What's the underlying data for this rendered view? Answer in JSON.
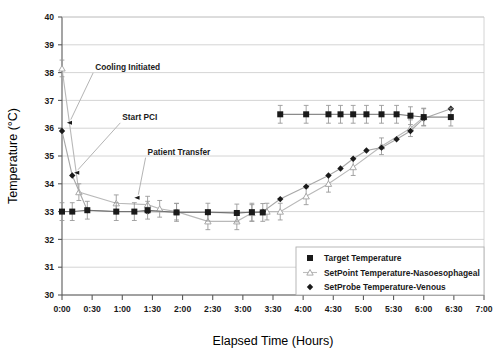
{
  "chart_data": {
    "type": "line",
    "title": "",
    "xlabel": "Elapsed Time (Hours)",
    "ylabel": "Temperature (°C)",
    "ylim": [
      30,
      40
    ],
    "ytick_labels": [
      "30",
      "31",
      "32",
      "33",
      "34",
      "35",
      "36",
      "37",
      "38",
      "39",
      "40"
    ],
    "ytick_values": [
      30,
      31,
      32,
      33,
      34,
      35,
      36,
      37,
      38,
      39,
      40
    ],
    "xlim_hours": [
      0,
      7
    ],
    "xtick_labels": [
      "0:00",
      "0:30",
      "1:00",
      "1:30",
      "2:00",
      "2:30",
      "3:00",
      "3:30",
      "4:00",
      "4:30",
      "5:00",
      "5:30",
      "6:00",
      "6:30",
      "7:00"
    ],
    "xtick_values_hours": [
      0,
      0.5,
      1,
      1.5,
      2,
      2.5,
      3,
      3.5,
      4,
      4.5,
      5,
      5.5,
      6,
      6.5,
      7
    ],
    "grid": "horizontal",
    "legend_position": "inside-bottom-right",
    "series": [
      {
        "name": "Target Temperature",
        "marker": "filled-square",
        "color": "#1a1a1a",
        "has_error_bars": true,
        "error": 0.32,
        "points": [
          {
            "x": 0.0,
            "y": 33.0
          },
          {
            "x": 0.17,
            "y": 33.0
          },
          {
            "x": 0.42,
            "y": 33.05
          },
          {
            "x": 0.9,
            "y": 33.0
          },
          {
            "x": 1.2,
            "y": 33.0
          },
          {
            "x": 1.42,
            "y": 33.05
          },
          {
            "x": 1.9,
            "y": 32.97
          },
          {
            "x": 2.42,
            "y": 32.98
          },
          {
            "x": 2.9,
            "y": 32.95
          },
          {
            "x": 3.15,
            "y": 32.98
          },
          {
            "x": 3.33,
            "y": 32.97
          },
          {
            "x": 3.62,
            "y": 36.5
          },
          {
            "x": 4.05,
            "y": 36.5
          },
          {
            "x": 4.42,
            "y": 36.5
          },
          {
            "x": 4.62,
            "y": 36.5
          },
          {
            "x": 4.83,
            "y": 36.5
          },
          {
            "x": 5.05,
            "y": 36.5
          },
          {
            "x": 5.3,
            "y": 36.5
          },
          {
            "x": 5.55,
            "y": 36.5
          },
          {
            "x": 5.78,
            "y": 36.45
          },
          {
            "x": 6.0,
            "y": 36.4
          },
          {
            "x": 6.45,
            "y": 36.4
          }
        ]
      },
      {
        "name": "SetPoint Temperature-Nasoesophageal",
        "marker": "open-triangle",
        "color": "#b9b9b9",
        "has_error_bars": true,
        "error": 0.3,
        "points": [
          {
            "x": 0.0,
            "y": 38.15
          },
          {
            "x": 0.28,
            "y": 33.7
          },
          {
            "x": 0.9,
            "y": 33.3
          },
          {
            "x": 1.42,
            "y": 33.25
          },
          {
            "x": 1.62,
            "y": 33.1
          },
          {
            "x": 1.9,
            "y": 33.0
          },
          {
            "x": 2.42,
            "y": 32.65
          },
          {
            "x": 2.9,
            "y": 32.65
          },
          {
            "x": 3.15,
            "y": 32.95
          },
          {
            "x": 3.4,
            "y": 33.0
          },
          {
            "x": 3.62,
            "y": 33.0
          },
          {
            "x": 4.05,
            "y": 33.55
          },
          {
            "x": 4.42,
            "y": 34.0
          },
          {
            "x": 4.83,
            "y": 34.6
          },
          {
            "x": 5.3,
            "y": 35.35
          },
          {
            "x": 5.78,
            "y": 36.0
          },
          {
            "x": 6.0,
            "y": 36.4
          }
        ]
      },
      {
        "name": "SetProbe Temperature-Venous",
        "marker": "filled-diamond",
        "color": "#1a1a1a",
        "has_error_bars": false,
        "points": [
          {
            "x": 0.0,
            "y": 35.9
          },
          {
            "x": 0.17,
            "y": 34.3
          },
          {
            "x": 0.42,
            "y": 33.05
          },
          {
            "x": 0.9,
            "y": 33.0
          },
          {
            "x": 1.42,
            "y": 33.0
          },
          {
            "x": 1.9,
            "y": 32.98
          },
          {
            "x": 2.42,
            "y": 32.97
          },
          {
            "x": 2.9,
            "y": 32.95
          },
          {
            "x": 3.33,
            "y": 33.0
          },
          {
            "x": 3.62,
            "y": 33.45
          },
          {
            "x": 4.05,
            "y": 33.9
          },
          {
            "x": 4.42,
            "y": 34.3
          },
          {
            "x": 4.62,
            "y": 34.55
          },
          {
            "x": 4.83,
            "y": 34.9
          },
          {
            "x": 5.05,
            "y": 35.2
          },
          {
            "x": 5.3,
            "y": 35.3
          },
          {
            "x": 5.55,
            "y": 35.6
          },
          {
            "x": 5.78,
            "y": 35.9
          },
          {
            "x": 6.0,
            "y": 36.35
          },
          {
            "x": 6.45,
            "y": 36.7
          }
        ]
      }
    ],
    "annotations": [
      {
        "text": "Cooling Initiated",
        "label_x_hours": 0.55,
        "label_y": 38.1,
        "target_x_hours": 0.08,
        "target_y": 36.2
      },
      {
        "text": "Start PCI",
        "label_x_hours": 1.0,
        "label_y": 36.3,
        "target_x_hours": 0.2,
        "target_y": 34.4
      },
      {
        "text": "Patient Transfer",
        "label_x_hours": 1.42,
        "label_y": 35.05,
        "target_x_hours": 1.2,
        "target_y": 33.5
      }
    ]
  },
  "legend": {
    "entries": [
      {
        "label": "Target Temperature",
        "marker": "filled-square"
      },
      {
        "label": "SetPoint Temperature-Nasoesophageal",
        "marker": "open-triangle"
      },
      {
        "label": "SetProbe Temperature-Venous",
        "marker": "filled-diamond"
      }
    ]
  }
}
